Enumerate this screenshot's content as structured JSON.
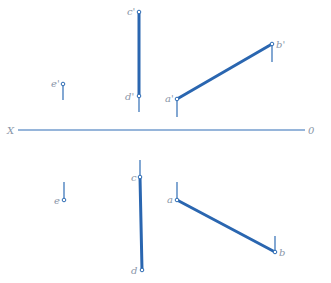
{
  "diagram": {
    "title": "",
    "axis": {
      "left_label": "X",
      "right_label": "0",
      "y": 130,
      "x1": 18,
      "x2": 305
    },
    "colors": {
      "line": "#2a66b0",
      "label": "#8a96a8",
      "background": "#ffffff"
    },
    "front_view": {
      "points": [
        {
          "name": "c'",
          "label": "c'",
          "x": 139,
          "y": 12
        },
        {
          "name": "d'",
          "label": "d'",
          "x": 139,
          "y": 96
        },
        {
          "name": "e'",
          "label": "e'",
          "x": 63,
          "y": 84
        },
        {
          "name": "a'",
          "label": "a'",
          "x": 177,
          "y": 99
        },
        {
          "name": "b'",
          "label": "b'",
          "x": 272,
          "y": 44
        }
      ],
      "segments": [
        {
          "from": "c'",
          "to": "d'",
          "style": "thick"
        },
        {
          "from": "a'",
          "to": "b'",
          "style": "thick"
        }
      ]
    },
    "top_view": {
      "points": [
        {
          "name": "c",
          "label": "c",
          "x": 140,
          "y": 177
        },
        {
          "name": "d",
          "label": "d",
          "x": 142,
          "y": 270
        },
        {
          "name": "e",
          "label": "e",
          "x": 64,
          "y": 200
        },
        {
          "name": "a",
          "label": "a",
          "x": 177,
          "y": 200
        },
        {
          "name": "b",
          "label": "b",
          "x": 275,
          "y": 252
        }
      ],
      "segments": [
        {
          "from": "c",
          "to": "d",
          "style": "thick"
        },
        {
          "from": "a",
          "to": "b",
          "style": "thick"
        }
      ]
    },
    "labels": {
      "c_prime": "c'",
      "d_prime": "d'",
      "e_prime": "e'",
      "a_prime": "a'",
      "b_prime": "b'",
      "c": "c",
      "d": "d",
      "e": "e",
      "a": "a",
      "b": "b",
      "axis_x": "X",
      "axis_o": "0"
    }
  }
}
